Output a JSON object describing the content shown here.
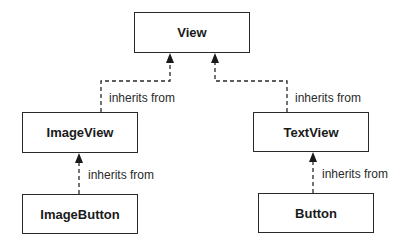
{
  "diagram": {
    "type": "class-inheritance-hierarchy",
    "nodes": [
      {
        "id": "view",
        "label": "View"
      },
      {
        "id": "imageview",
        "label": "ImageView"
      },
      {
        "id": "textview",
        "label": "TextView"
      },
      {
        "id": "imagebutton",
        "label": "ImageButton"
      },
      {
        "id": "button",
        "label": "Button"
      }
    ],
    "edges": [
      {
        "from": "imageview",
        "to": "view",
        "label": "inherits from"
      },
      {
        "from": "textview",
        "to": "view",
        "label": "inherits from"
      },
      {
        "from": "imagebutton",
        "to": "imageview",
        "label": "inherits from"
      },
      {
        "from": "button",
        "to": "textview",
        "label": "inherits from"
      }
    ],
    "colors": {
      "line": "#2a2a2a",
      "background": "#ffffff"
    }
  }
}
